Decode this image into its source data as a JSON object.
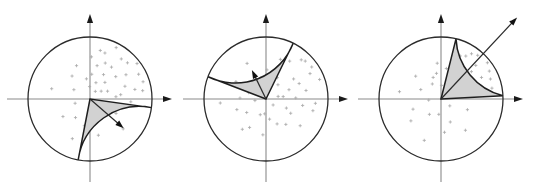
{
  "figure": {
    "width": 534,
    "height": 191,
    "background_color": "#ffffff",
    "circle_stroke_color": "#2b2b2b",
    "axis_color": "#8a8a8a",
    "wedge_fill_color": "#d2d2d2",
    "wedge_stroke_color": "#1e1e1e",
    "point_color": "#a8a8a8",
    "arrow_color": "#111111"
  },
  "chart_data": {
    "type": "scatter",
    "xlabel": "",
    "ylabel": "",
    "coordinate_system": "polar-unit-circle",
    "xlim": [
      -1,
      1
    ],
    "ylim": [
      -1,
      1
    ],
    "grid": false,
    "legend": "none",
    "panels": [
      {
        "name": "panel-left",
        "index": 1,
        "center_px": [
          90,
          99
        ],
        "radius_px": 62,
        "sector": {
          "start_angle_deg": -101,
          "end_angle_deg": -8,
          "fill": "#d2d2d2"
        },
        "mean_arrow": {
          "angle_deg": -41,
          "length_fraction": 0.72
        },
        "axes": {
          "x_arrow_end_px": [
            172,
            99
          ],
          "y_arrow_end_px": [
            90,
            14
          ]
        },
        "points_polar": [
          [
            0.78,
            72
          ],
          [
            0.93,
            63
          ],
          [
            0.62,
            56
          ],
          [
            0.84,
            44
          ],
          [
            0.55,
            78
          ],
          [
            0.7,
            34
          ],
          [
            0.45,
            61
          ],
          [
            0.88,
            27
          ],
          [
            0.36,
            48
          ],
          [
            0.6,
            20
          ],
          [
            0.95,
            37
          ],
          [
            0.5,
            8
          ],
          [
            0.28,
            70
          ],
          [
            0.74,
            12
          ],
          [
            0.4,
            86
          ],
          [
            0.66,
            -4
          ],
          [
            0.22,
            35
          ],
          [
            0.82,
            52
          ],
          [
            0.33,
            100
          ],
          [
            0.58,
            112
          ],
          [
            0.47,
            128
          ],
          [
            0.3,
            150
          ],
          [
            0.64,
            165
          ],
          [
            0.25,
            196
          ],
          [
            0.52,
            213
          ],
          [
            0.38,
            232
          ],
          [
            0.7,
            246
          ],
          [
            0.44,
            258
          ],
          [
            0.18,
            268
          ],
          [
            0.6,
            283
          ],
          [
            0.35,
            300
          ],
          [
            0.72,
            318
          ],
          [
            0.48,
            331
          ],
          [
            0.26,
            342
          ],
          [
            0.9,
            18
          ],
          [
            0.15,
            55
          ],
          [
            0.68,
            88
          ],
          [
            0.42,
            5
          ],
          [
            0.8,
            78
          ],
          [
            0.55,
            41
          ],
          [
            0.31,
            24
          ],
          [
            0.86,
            9
          ],
          [
            0.2,
            92
          ],
          [
            0.63,
            67
          ]
        ]
      },
      {
        "name": "panel-middle",
        "index": 2,
        "center_px": [
          266,
          99
        ],
        "radius_px": 62,
        "sector": {
          "start_angle_deg": 64,
          "end_angle_deg": 159,
          "fill": "#d2d2d2"
        },
        "mean_arrow": {
          "angle_deg": 116,
          "length_fraction": 0.52
        },
        "axes": {
          "x_arrow_end_px": [
            348,
            99
          ],
          "y_arrow_end_px": [
            266,
            14
          ]
        },
        "points_polar": [
          [
            0.72,
            58
          ],
          [
            0.88,
            44
          ],
          [
            0.55,
            36
          ],
          [
            0.4,
            22
          ],
          [
            0.66,
            12
          ],
          [
            0.3,
            50
          ],
          [
            0.82,
            30
          ],
          [
            0.48,
            2
          ],
          [
            0.25,
            68
          ],
          [
            0.6,
            -10
          ],
          [
            0.92,
            20
          ],
          [
            0.36,
            -24
          ],
          [
            0.7,
            -38
          ],
          [
            0.2,
            12
          ],
          [
            0.52,
            -52
          ],
          [
            0.44,
            -66
          ],
          [
            0.78,
            -14
          ],
          [
            0.33,
            -80
          ],
          [
            0.58,
            -95
          ],
          [
            0.27,
            -110
          ],
          [
            0.62,
            -128
          ],
          [
            0.38,
            -145
          ],
          [
            0.5,
            -160
          ],
          [
            0.18,
            -172
          ],
          [
            0.74,
            -175
          ],
          [
            0.42,
            178
          ],
          [
            0.3,
            160
          ],
          [
            0.56,
            150
          ],
          [
            0.22,
            132
          ],
          [
            0.65,
            118
          ],
          [
            0.35,
            104
          ],
          [
            0.47,
            88
          ],
          [
            0.85,
            48
          ],
          [
            0.28,
            8
          ],
          [
            0.68,
            70
          ],
          [
            0.15,
            -40
          ],
          [
            0.8,
            -5
          ],
          [
            0.39,
            62
          ],
          [
            0.59,
            25
          ],
          [
            0.46,
            -30
          ],
          [
            0.9,
            35
          ],
          [
            0.24,
            -95
          ],
          [
            0.53,
            -120
          ],
          [
            0.32,
            95
          ]
        ]
      },
      {
        "name": "panel-right",
        "index": 3,
        "center_px": [
          441,
          99
        ],
        "radius_px": 62,
        "sector": {
          "start_angle_deg": 3,
          "end_angle_deg": 76,
          "fill": "#d2d2d2"
        },
        "mean_arrow": {
          "angle_deg": 47,
          "length_fraction": 1.8
        },
        "axes": {
          "x_arrow_end_px": [
            523,
            99
          ],
          "y_arrow_end_px": [
            441,
            14
          ]
        },
        "points_polar": [
          [
            0.8,
            60
          ],
          [
            0.92,
            50
          ],
          [
            0.66,
            42
          ],
          [
            0.52,
            35
          ],
          [
            0.74,
            28
          ],
          [
            0.38,
            55
          ],
          [
            0.86,
            22
          ],
          [
            0.58,
            14
          ],
          [
            0.3,
            46
          ],
          [
            0.7,
            6
          ],
          [
            0.95,
            38
          ],
          [
            0.44,
            68
          ],
          [
            0.62,
            72
          ],
          [
            0.24,
            30
          ],
          [
            0.5,
            80
          ],
          [
            0.84,
            12
          ],
          [
            0.34,
            16
          ],
          [
            0.76,
            66
          ],
          [
            0.42,
            100
          ],
          [
            0.28,
            120
          ],
          [
            0.55,
            138
          ],
          [
            0.36,
            155
          ],
          [
            0.68,
            170
          ],
          [
            0.2,
            185
          ],
          [
            0.48,
            200
          ],
          [
            0.6,
            216
          ],
          [
            0.31,
            233
          ],
          [
            0.72,
            248
          ],
          [
            0.25,
            262
          ],
          [
            0.54,
            276
          ],
          [
            0.4,
            292
          ],
          [
            0.64,
            308
          ],
          [
            0.18,
            322
          ],
          [
            0.46,
            338
          ],
          [
            0.88,
            56
          ],
          [
            0.22,
            88
          ],
          [
            0.58,
            96
          ],
          [
            0.33,
            8
          ],
          [
            0.78,
            44
          ],
          [
            0.5,
            24
          ],
          [
            0.26,
            64
          ],
          [
            0.9,
            30
          ],
          [
            0.37,
            110
          ],
          [
            0.68,
            18
          ]
        ]
      }
    ]
  }
}
